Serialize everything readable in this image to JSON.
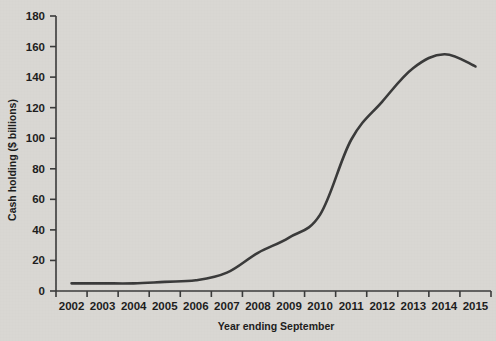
{
  "chart_data": {
    "type": "line",
    "title": "",
    "subtitle": "",
    "xlabel": "Year ending September",
    "ylabel": "Cash holding ($ billions)",
    "categories": [
      "2002",
      "2003",
      "2004",
      "2005",
      "2006",
      "2007",
      "2008",
      "2009",
      "2010",
      "2011",
      "2012",
      "2013",
      "2014",
      "2015"
    ],
    "x": [
      2002,
      2003,
      2004,
      2005,
      2006,
      2007,
      2008,
      2009,
      2010,
      2011,
      2012,
      2013,
      2014,
      2015
    ],
    "values": [
      5,
      5,
      5,
      6,
      7,
      12,
      25,
      35,
      50,
      99,
      124,
      146,
      155,
      147
    ],
    "series": [
      {
        "name": "Cash holding",
        "values": [
          5,
          5,
          5,
          6,
          7,
          12,
          25,
          35,
          50,
          99,
          124,
          146,
          155,
          147
        ],
        "color": "#3a3a3a"
      }
    ],
    "ylim": [
      0,
      180
    ],
    "yticks": [
      0,
      20,
      40,
      60,
      80,
      100,
      120,
      140,
      160,
      180
    ],
    "ytick_labels": [
      "0",
      "20",
      "40",
      "60",
      "80",
      "100",
      "120",
      "140",
      "160",
      "180"
    ],
    "xtick_labels": [
      "2002",
      "2003",
      "2004",
      "2005",
      "2006",
      "2007",
      "2008",
      "2009",
      "2010",
      "2011",
      "2012",
      "2013",
      "2014",
      "2015"
    ],
    "grid": false,
    "legend": "none",
    "annotations": [],
    "colors": {
      "background": "#d9d7d3",
      "line": "#3a3a3a",
      "axis": "#3a3a3a",
      "text": "#1d1d1d"
    }
  }
}
